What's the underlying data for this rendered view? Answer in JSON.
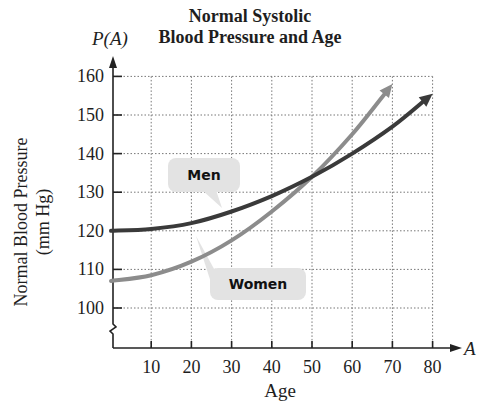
{
  "chart_data": {
    "type": "line",
    "title": "Normal Systolic Blood Pressure and Age",
    "title_lines": [
      "Normal Systolic",
      "Blood Pressure and Age"
    ],
    "function_label": "P(A)",
    "xlabel": "Age",
    "x_variable": "A",
    "ylabel": "Normal Blood Pressure (mm Hg)",
    "ylabel_lines": [
      "Normal Blood Pressure",
      "(mm Hg)"
    ],
    "xlim": [
      0,
      80
    ],
    "ylim": [
      100,
      160
    ],
    "y_axis_break": true,
    "grid": true,
    "x_ticks": [
      10,
      20,
      30,
      40,
      50,
      60,
      70,
      80
    ],
    "y_ticks": [
      100,
      110,
      120,
      130,
      140,
      150,
      160
    ],
    "series": [
      {
        "name": "Men",
        "color": "#3a3a3a",
        "x": [
          0,
          10,
          20,
          30,
          40,
          50,
          60,
          70,
          80
        ],
        "values": [
          120,
          120.5,
          122,
          125,
          129,
          134,
          140,
          147,
          155.5
        ]
      },
      {
        "name": "Women",
        "color": "#8c8c8c",
        "x": [
          0,
          10,
          20,
          30,
          40,
          50,
          60,
          70
        ],
        "values": [
          107,
          108.5,
          112,
          117.5,
          125,
          134,
          145,
          158
        ]
      }
    ],
    "annotations": [
      {
        "text": "Men",
        "points_to": "Men"
      },
      {
        "text": "Women",
        "points_to": "Women"
      }
    ],
    "legend": "callout labels"
  }
}
